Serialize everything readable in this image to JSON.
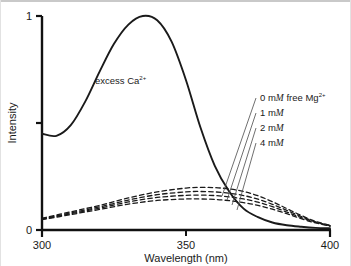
{
  "chart_data": {
    "type": "line",
    "title": "",
    "xlabel": "Wavelength   (nm)",
    "ylabel": "Intensity",
    "xlim": [
      300,
      400
    ],
    "ylim": [
      0,
      1
    ],
    "xticks": [
      300,
      350,
      400
    ],
    "xtick_labels": [
      "300",
      "350",
      "400"
    ],
    "yticks": [
      0,
      0.5,
      1
    ],
    "ytick_labels": [
      "0",
      "",
      "1"
    ],
    "grid": false,
    "legend_position": "inside-right",
    "series": [
      {
        "name": "excess Ca2+",
        "style": "solid",
        "x": [
          300,
          305,
          310,
          315,
          320,
          325,
          330,
          335,
          340,
          345,
          350,
          355,
          360,
          365,
          370,
          375,
          380,
          385,
          390,
          395,
          400
        ],
        "y": [
          0.45,
          0.44,
          0.49,
          0.6,
          0.74,
          0.87,
          0.96,
          1.0,
          0.98,
          0.88,
          0.7,
          0.48,
          0.3,
          0.18,
          0.1,
          0.06,
          0.035,
          0.022,
          0.015,
          0.01,
          0.008
        ]
      },
      {
        "name": "0 mM free Mg2+",
        "style": "dashed",
        "x": [
          300,
          310,
          320,
          330,
          340,
          350,
          355,
          360,
          365,
          370,
          375,
          380,
          385,
          390,
          395,
          400
        ],
        "y": [
          0.055,
          0.085,
          0.115,
          0.15,
          0.178,
          0.196,
          0.199,
          0.198,
          0.192,
          0.18,
          0.16,
          0.132,
          0.1,
          0.068,
          0.04,
          0.022
        ]
      },
      {
        "name": "1 mM",
        "style": "dashed",
        "x": [
          300,
          310,
          320,
          330,
          340,
          350,
          355,
          360,
          365,
          370,
          375,
          380,
          385,
          390,
          395,
          400
        ],
        "y": [
          0.052,
          0.08,
          0.108,
          0.14,
          0.165,
          0.178,
          0.18,
          0.178,
          0.172,
          0.161,
          0.144,
          0.12,
          0.092,
          0.063,
          0.038,
          0.02
        ]
      },
      {
        "name": "2 mM",
        "style": "dashed",
        "x": [
          300,
          310,
          320,
          330,
          340,
          350,
          355,
          360,
          365,
          370,
          375,
          380,
          385,
          390,
          395,
          400
        ],
        "y": [
          0.05,
          0.076,
          0.102,
          0.131,
          0.152,
          0.162,
          0.163,
          0.161,
          0.155,
          0.145,
          0.13,
          0.109,
          0.084,
          0.058,
          0.036,
          0.019
        ]
      },
      {
        "name": "4 mM",
        "style": "dashed",
        "x": [
          300,
          310,
          320,
          330,
          340,
          350,
          355,
          360,
          365,
          370,
          375,
          380,
          385,
          390,
          395,
          400
        ],
        "y": [
          0.048,
          0.072,
          0.096,
          0.121,
          0.138,
          0.145,
          0.145,
          0.143,
          0.137,
          0.128,
          0.115,
          0.097,
          0.076,
          0.053,
          0.033,
          0.018
        ]
      }
    ],
    "annotations": [
      {
        "name": "excess-ca-label",
        "text_main": "excess  Ca",
        "text_sup": "2+",
        "x_px": 95,
        "y_px": 84
      }
    ],
    "legend_entries": [
      {
        "text_pre": "0 m",
        "text_ital": "M",
        "text_post": " free  Mg",
        "text_sup": "2+"
      },
      {
        "text_pre": "1 m",
        "text_ital": "M",
        "text_post": "",
        "text_sup": ""
      },
      {
        "text_pre": "2 m",
        "text_ital": "M",
        "text_post": "",
        "text_sup": ""
      },
      {
        "text_pre": "4 m",
        "text_ital": "M",
        "text_post": "",
        "text_sup": ""
      }
    ],
    "colors": {
      "axis": "#111111",
      "curve": "#1a1a1a",
      "text": "#1a1a1a",
      "background": "#ffffff",
      "border": "#c9c9c9"
    }
  },
  "axis": {
    "y_label": "Intensity",
    "x_label": "Wavelength   (nm)",
    "y_max_label": "1",
    "y_min_label": "0",
    "x_tick_0": "300",
    "x_tick_1": "350",
    "x_tick_2": "400"
  },
  "annotation": {
    "excess_ca_main": "excess  Ca",
    "excess_ca_sup": "2+"
  },
  "legend": {
    "row0_pre": "0 m",
    "row0_ital": "M",
    "row0_post": " free  Mg",
    "row0_sup": "2+",
    "row1_pre": "1 m",
    "row1_ital": "M",
    "row2_pre": "2 m",
    "row2_ital": "M",
    "row3_pre": "4 m",
    "row3_ital": "M"
  }
}
